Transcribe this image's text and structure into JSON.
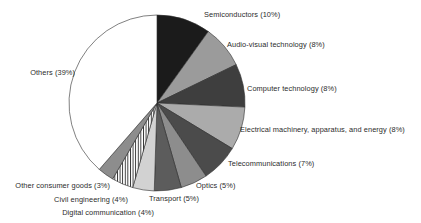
{
  "chart_data": {
    "type": "pie",
    "title": "",
    "subtitle": "",
    "xlabel": "",
    "ylabel": "",
    "legend_position": "none",
    "label_format": "{name} ({value}%)",
    "start_angle_deg": 0,
    "direction": "clockwise",
    "grid": false,
    "total": 101,
    "units": "percent",
    "categories": [
      "Semiconductors",
      "Audio-visual technology",
      "Computer technology",
      "Electrical machinery, apparatus, and energy",
      "Telecommunications",
      "Optics",
      "Transport",
      "Digital communication",
      "Civil engineering",
      "Other consumer goods",
      "Others"
    ],
    "values": [
      10,
      8,
      8,
      8,
      7,
      5,
      5,
      4,
      4,
      3,
      39
    ],
    "slices": [
      {
        "name": "Semiconductors",
        "value": 10,
        "label": "Semiconductors (10%)",
        "fill": "#1b1b1b",
        "pattern": "solid",
        "label_x": 204,
        "label_y": 11,
        "label_side": "right"
      },
      {
        "name": "Audio-visual technology",
        "value": 8,
        "label": "Audio-visual technology (8%)",
        "fill": "#9b9b9b",
        "pattern": "solid",
        "label_x": 227,
        "label_y": 41,
        "label_side": "right"
      },
      {
        "name": "Computer technology",
        "value": 8,
        "label": "Computer technology (8%)",
        "fill": "#3e3e3e",
        "pattern": "solid",
        "label_x": 247,
        "label_y": 85,
        "label_side": "right"
      },
      {
        "name": "Electrical machinery, apparatus, and energy",
        "value": 8,
        "label": "Electrical machinery, apparatus, and energy (8%)",
        "fill": "#ababab",
        "pattern": "solid",
        "label_x": 240,
        "label_y": 126,
        "label_side": "right"
      },
      {
        "name": "Telecommunications",
        "value": 7,
        "label": "Telecommunications (7%)",
        "fill": "#4b4b4b",
        "pattern": "solid",
        "label_x": 228,
        "label_y": 160,
        "label_side": "right"
      },
      {
        "name": "Optics",
        "value": 5,
        "label": "Optics (5%)",
        "fill": "#8d8d8d",
        "pattern": "solid",
        "label_x": 196,
        "label_y": 182,
        "label_side": "right"
      },
      {
        "name": "Transport",
        "value": 5,
        "label": "Transport (5%)",
        "fill": "#5c5c5c",
        "pattern": "solid",
        "label_x": 149,
        "label_y": 195,
        "label_side": "right"
      },
      {
        "name": "Digital communication",
        "value": 4,
        "label": "Digital communication (4%)",
        "fill": "#d2d2d2",
        "pattern": "solid",
        "label_x": 154,
        "label_y": 209,
        "label_side": "left"
      },
      {
        "name": "Civil engineering",
        "value": 4,
        "label": "Civil engineering (4%)",
        "fill": "#ffffff",
        "pattern": "vertical-stripes",
        "label_x": 128,
        "label_y": 196,
        "label_side": "left"
      },
      {
        "name": "Other consumer goods",
        "value": 3,
        "label": "Other consumer goods (3%)",
        "fill": "#8d8d8d",
        "pattern": "solid",
        "label_x": 110,
        "label_y": 182,
        "label_side": "left"
      },
      {
        "name": "Others",
        "value": 39,
        "label": "Others (39%)",
        "fill": "#ffffff",
        "pattern": "solid",
        "label_x": 75,
        "label_y": 69,
        "label_side": "left"
      }
    ],
    "geometry": {
      "center_x": 157,
      "center_y": 103,
      "radius": 88,
      "stroke": "#2b2b2b",
      "stroke_width": 0.6
    }
  }
}
